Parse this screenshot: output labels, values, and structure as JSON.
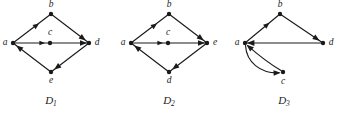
{
  "figure": {
    "background_color": "#ffffff",
    "ink_color": "#1a1a1a",
    "diagram_count": 3
  },
  "diagrams": [
    {
      "id": "D1",
      "caption_base": "D",
      "caption_sub": "1",
      "caption_text": "D1",
      "vertices": [
        {
          "name": "a",
          "label": "a",
          "x": 13,
          "y": 43,
          "label_x": 5,
          "label_y": 43
        },
        {
          "name": "b",
          "label": "b",
          "x": 51,
          "y": 14,
          "label_x": 51,
          "label_y": 5
        },
        {
          "name": "c",
          "label": "c",
          "x": 50,
          "y": 43,
          "label_x": 50,
          "label_y": 33
        },
        {
          "name": "d",
          "label": "d",
          "x": 89,
          "y": 43,
          "label_x": 97,
          "label_y": 43
        },
        {
          "name": "e",
          "label": "e",
          "x": 51,
          "y": 72,
          "label_x": 51,
          "label_y": 81
        }
      ],
      "edges": [
        {
          "from": "a",
          "to": "b",
          "type": "straight",
          "arrow_at": "mid"
        },
        {
          "from": "b",
          "to": "d",
          "type": "straight",
          "arrow_at": "end"
        },
        {
          "from": "a",
          "to": "c",
          "type": "straight",
          "arrow_at": "mid"
        },
        {
          "from": "c",
          "to": "d",
          "type": "straight",
          "arrow_at": "end"
        },
        {
          "from": "d",
          "to": "e",
          "type": "straight",
          "arrow_at": "end"
        },
        {
          "from": "e",
          "to": "a",
          "type": "straight",
          "arrow_at": "end"
        }
      ]
    },
    {
      "id": "D2",
      "caption_base": "D",
      "caption_sub": "2",
      "caption_text": "D2",
      "vertices": [
        {
          "name": "a",
          "label": "a",
          "x": 131,
          "y": 43,
          "label_x": 123,
          "label_y": 43
        },
        {
          "name": "b",
          "label": "b",
          "x": 169,
          "y": 14,
          "label_x": 169,
          "label_y": 5
        },
        {
          "name": "c",
          "label": "c",
          "x": 168,
          "y": 43,
          "label_x": 168,
          "label_y": 33
        },
        {
          "name": "e",
          "label": "e",
          "x": 207,
          "y": 43,
          "label_x": 215,
          "label_y": 43
        },
        {
          "name": "d",
          "label": "d",
          "x": 169,
          "y": 72,
          "label_x": 169,
          "label_y": 81
        }
      ],
      "edges": [
        {
          "from": "a",
          "to": "b",
          "type": "straight",
          "arrow_at": "mid"
        },
        {
          "from": "b",
          "to": "e",
          "type": "straight",
          "arrow_at": "end"
        },
        {
          "from": "a",
          "to": "c",
          "type": "straight",
          "arrow_at": "mid"
        },
        {
          "from": "c",
          "to": "e",
          "type": "straight",
          "arrow_at": "end"
        },
        {
          "from": "e",
          "to": "d",
          "type": "straight",
          "arrow_at": "end"
        },
        {
          "from": "d",
          "to": "a",
          "type": "straight",
          "arrow_at": "end"
        }
      ]
    },
    {
      "id": "D3",
      "caption_base": "D",
      "caption_sub": "3",
      "caption_text": "D3",
      "vertices": [
        {
          "name": "a",
          "label": "a",
          "x": 245,
          "y": 43,
          "label_x": 237,
          "label_y": 43
        },
        {
          "name": "b",
          "label": "b",
          "x": 280,
          "y": 14,
          "label_x": 280,
          "label_y": 5
        },
        {
          "name": "d",
          "label": "d",
          "x": 323,
          "y": 43,
          "label_x": 331,
          "label_y": 43
        },
        {
          "name": "c",
          "label": "c",
          "x": 283,
          "y": 72,
          "label_x": 283,
          "label_y": 82
        }
      ],
      "edges": [
        {
          "from": "a",
          "to": "b",
          "type": "straight",
          "arrow_at": "mid"
        },
        {
          "from": "b",
          "to": "d",
          "type": "straight",
          "arrow_at": "end"
        },
        {
          "from": "d",
          "to": "a",
          "type": "straight",
          "arrow_at": "end"
        },
        {
          "from": "a",
          "to": "c",
          "type": "curved-lower",
          "arrow_at": "end"
        },
        {
          "from": "c",
          "to": "a",
          "type": "curved-upper",
          "arrow_at": "end"
        }
      ]
    }
  ],
  "captions": {
    "d1": {
      "base": "D",
      "sub": "1"
    },
    "d2": {
      "base": "D",
      "sub": "2"
    },
    "d3": {
      "base": "D",
      "sub": "3"
    }
  }
}
